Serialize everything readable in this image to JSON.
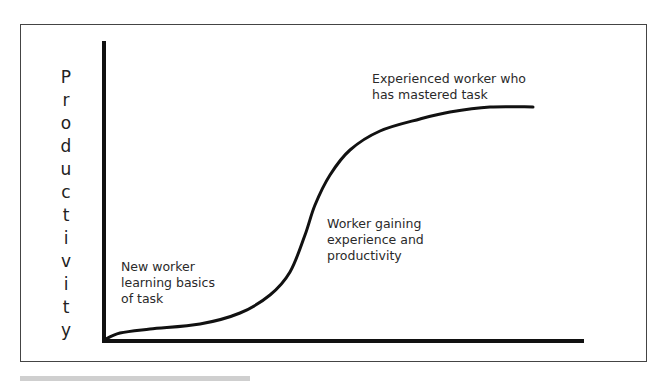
{
  "chart_data": {
    "type": "line",
    "title": "",
    "xlabel": "",
    "ylabel": "Productivity",
    "grid": false,
    "legend": null,
    "series": [
      {
        "name": "Productivity curve",
        "points_px": [
          [
            104,
            340
          ],
          [
            120,
            333
          ],
          [
            150,
            329
          ],
          [
            200,
            324
          ],
          [
            240,
            313
          ],
          [
            270,
            295
          ],
          [
            290,
            272
          ],
          [
            305,
            235
          ],
          [
            315,
            205
          ],
          [
            330,
            175
          ],
          [
            350,
            150
          ],
          [
            380,
            131
          ],
          [
            420,
            119
          ],
          [
            450,
            112
          ],
          [
            490,
            107
          ],
          [
            533,
            107
          ]
        ]
      }
    ],
    "annotations": [
      {
        "id": "stage1",
        "text": "New worker\nlearning basics\nof task"
      },
      {
        "id": "stage2",
        "text": "Worker gaining\nexperience and\nproductivity"
      },
      {
        "id": "stage3",
        "text": "Experienced worker who\nhas mastered task"
      }
    ]
  },
  "ylabel_letters": [
    "P",
    "r",
    "o",
    "d",
    "u",
    "c",
    "t",
    "i",
    "v",
    "i",
    "t",
    "y"
  ],
  "notes": {
    "stage1": "New worker\nlearning basics\nof task",
    "stage2": "Worker gaining\nexperience and\nproductivity",
    "stage3": "Experienced worker who\nhas mastered task"
  },
  "colors": {
    "axis": "#111111",
    "curve": "#111111",
    "frame": "#444444",
    "text": "#2a2a2a"
  }
}
